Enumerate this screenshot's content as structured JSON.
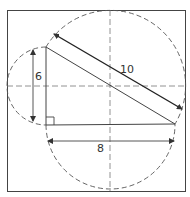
{
  "diagram": {
    "type": "geometry",
    "labels": {
      "side_vertical": "6",
      "side_horizontal": "8",
      "hypotenuse": "10"
    },
    "triangle": {
      "right_angle_vertex": [
        46,
        125
      ],
      "top_vertex": [
        46,
        47
      ],
      "right_vertex": [
        175,
        124
      ]
    },
    "colors": {
      "stroke": "#333333",
      "dashed": "#555555",
      "background": "#ffffff"
    }
  }
}
